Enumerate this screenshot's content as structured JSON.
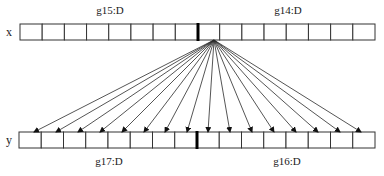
{
  "diagram": {
    "rows": {
      "x": {
        "label": "x",
        "top": 24,
        "height": 16,
        "left": 20,
        "right": 375,
        "cells": 16,
        "divider_x": 198,
        "groups": [
          {
            "label": "g15:D",
            "label_x": 110,
            "label_y": 14
          },
          {
            "label": "g14:D",
            "label_x": 288,
            "label_y": 14
          }
        ]
      },
      "y": {
        "label": "y",
        "top": 132,
        "height": 16,
        "left": 19,
        "right": 375,
        "cells": 16,
        "divider_x": 197,
        "groups": [
          {
            "label": "g17:D",
            "label_x": 109,
            "label_y": 165
          },
          {
            "label": "g16:D",
            "label_x": 287,
            "label_y": 165
          }
        ]
      }
    },
    "fan": {
      "source": {
        "x": 214,
        "y": 40
      },
      "target_y": 132,
      "targets_x": [
        34,
        56,
        78,
        100,
        122,
        144,
        165,
        187,
        208,
        230,
        252,
        274,
        296,
        318,
        340,
        361
      ]
    },
    "colors": {
      "stroke": "#333333",
      "divider": "#000000",
      "background": "#ffffff"
    }
  }
}
